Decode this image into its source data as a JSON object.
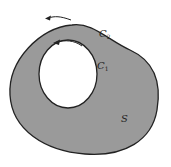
{
  "diagram": {
    "outer_curve": {
      "label": "C",
      "subscript": "2"
    },
    "inner_curve": {
      "label": "C",
      "subscript": "1"
    },
    "region": {
      "label": "S"
    },
    "colors": {
      "region_fill": "#9a9a9a",
      "stroke": "#222222",
      "hole_fill": "#ffffff"
    }
  }
}
